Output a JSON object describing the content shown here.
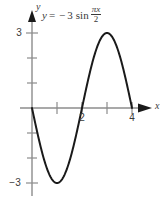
{
  "figure": {
    "equation": {
      "lhs": "y",
      "equals": "=",
      "minus": "−",
      "amplitude": "3",
      "function": "sin",
      "numerator": "πx",
      "denominator": "2",
      "full_text": "y = −3 sin πx/2"
    },
    "axis_labels": {
      "x": "x",
      "y": "y"
    },
    "tick_labels": {
      "y_top": "3",
      "y_bottom": "−3",
      "x_two": "2",
      "x_four": "4"
    },
    "colors": {
      "curve": "#1a1a1a",
      "axis": "#8c8c8c",
      "arrow": "#1a1a1a",
      "text": "#3a3a3a",
      "background": "#ffffff"
    }
  },
  "chart_data": {
    "type": "line",
    "xlabel": "x",
    "ylabel": "y",
    "xlim": [
      -0.2,
      4.6
    ],
    "ylim": [
      -3.6,
      3.6
    ],
    "grid": false,
    "legend": null,
    "x_ticks": [
      1,
      2,
      3,
      4
    ],
    "x_tick_labels": [
      "",
      "2",
      "",
      "4"
    ],
    "y_ticks": [
      -3,
      -2,
      -1,
      1,
      2,
      3
    ],
    "y_tick_labels": [
      "−3",
      "",
      "",
      "",
      "",
      "3"
    ],
    "series": [
      {
        "name": "y = -3 sin(pi*x/2)",
        "expression": "-3*sin(pi*x/2)",
        "domain": [
          0,
          4
        ],
        "x": [
          0,
          0.25,
          0.5,
          0.75,
          1,
          1.25,
          1.5,
          1.75,
          2,
          2.25,
          2.5,
          2.75,
          3,
          3.25,
          3.5,
          3.75,
          4
        ],
        "y": [
          0,
          -1.148,
          -2.121,
          -2.772,
          -3,
          -2.772,
          -2.121,
          -1.148,
          0,
          1.148,
          2.121,
          2.772,
          3,
          2.772,
          2.121,
          1.148,
          0
        ]
      }
    ],
    "key_points": [
      {
        "label": "start",
        "x": 0,
        "y": 0
      },
      {
        "label": "minimum",
        "x": 1,
        "y": -3
      },
      {
        "label": "zero",
        "x": 2,
        "y": 0
      },
      {
        "label": "maximum",
        "x": 3,
        "y": 3
      },
      {
        "label": "end",
        "x": 4,
        "y": 0
      }
    ],
    "amplitude": 3,
    "period": 4,
    "reflected": true
  }
}
